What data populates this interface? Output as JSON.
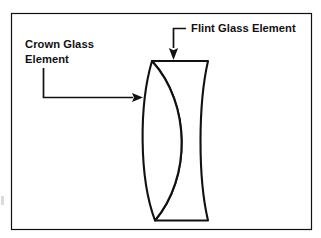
{
  "figure": {
    "background_color": "#ffffff",
    "line_color": "#111111",
    "frame": {
      "name": "figure-border",
      "x": 11.5,
      "y": 13.5,
      "width": 300,
      "height": 216,
      "stroke_width": 1.2
    },
    "labels": [
      {
        "id": "crown-glass",
        "name": "crown-glass-element-label",
        "lines": [
          "Crown Glass",
          "Element"
        ],
        "x": 25,
        "y_first_line": 48,
        "line_height": 14.5,
        "anchor": "start"
      },
      {
        "id": "flint-glass",
        "name": "flint-glass-element-label",
        "lines": [
          "Flint Glass Element"
        ],
        "x": 191,
        "y_first_line": 32,
        "line_height": 14.5,
        "anchor": "start"
      }
    ],
    "leaders": [
      {
        "id": "crown-leader",
        "name": "crown-glass-leader-line",
        "path": "M 43.5 68 L 43.5 97.5 L 133 97.5",
        "arrow": {
          "tip_x": 143,
          "tip_y": 97.5,
          "direction": "right",
          "length": 11,
          "half_width": 4.4
        }
      },
      {
        "id": "flint-leader",
        "name": "flint-glass-leader-line",
        "path": "M 186 28.5 L 173.5 28.5 L 173.5 48",
        "arrow": {
          "tip_x": 173.5,
          "tip_y": 60,
          "direction": "down",
          "length": 12,
          "half_width": 4.6
        }
      }
    ],
    "lens_assembly": {
      "name": "doublet-lens-drawing",
      "top_y": 61,
      "bottom_y": 220.5,
      "top_left_x": 152,
      "top_right_x": 208,
      "bottom_left_x": 155,
      "bottom_right_x": 208,
      "stroke_width": 2.1,
      "elements": [
        {
          "id": "crown-element",
          "name": "crown-glass-element-shape",
          "shape": "biconvex",
          "outline": "M 152 61 C 139 105 139 178 155 220.5 C 191 178 191 104 152 61 Z",
          "left_bulge_x": 140,
          "right_edge_x": 178
        },
        {
          "id": "flint-element",
          "name": "flint-glass-element-shape",
          "shape": "concave-meniscus",
          "outline": "M 152 61 L 208 61 C 198 105 198 178 208 220.5 L 155 220.5 C 191 178 191 104 152 61 Z",
          "right_edge_x": 208
        }
      ]
    },
    "artifacts": [
      {
        "id": "scan-speck",
        "name": "scan-artifact-speck",
        "x": 1,
        "y": 196,
        "width": 3,
        "height": 9,
        "opacity": 0.22
      }
    ]
  }
}
